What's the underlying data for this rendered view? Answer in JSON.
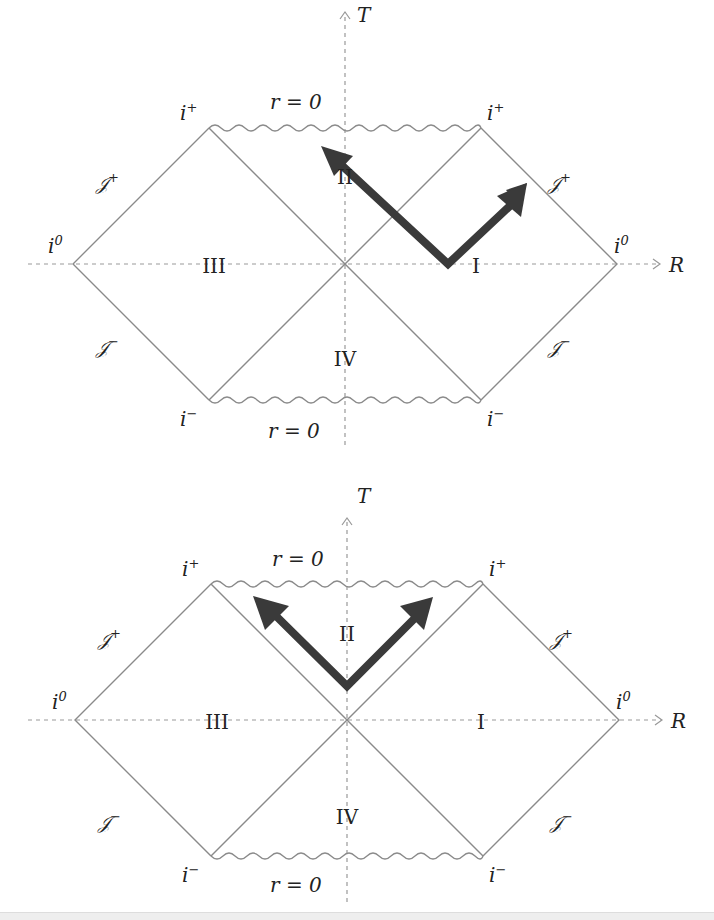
{
  "figure": {
    "colors": {
      "line": "#8a8a8a",
      "axis": "#999999",
      "arrow": "#3a3a3a",
      "text": "#222222"
    }
  },
  "diagrams": [
    {
      "id": "top",
      "axis_labels": {
        "time": "T",
        "space": "R"
      },
      "singularity_labels": {
        "future": "r = 0",
        "past": "r = 0"
      },
      "corner_labels": {
        "future_timelike_left": "i+",
        "future_timelike_right": "i+",
        "past_timelike_left": "i−",
        "past_timelike_right": "i−",
        "spatial_left": "i0",
        "spatial_right": "i0"
      },
      "null_infinity_labels": {
        "future_left": "𝒥+",
        "future_right": "𝒥+",
        "past_left": "𝒥−",
        "past_right": "𝒥−"
      },
      "regions": [
        "I",
        "II",
        "III",
        "IV"
      ],
      "arrows": [
        {
          "from_region": "I",
          "direction": "up-left",
          "into_region": "II"
        },
        {
          "from_region": "I",
          "direction": "up-right",
          "toward": "𝒥+"
        }
      ]
    },
    {
      "id": "bottom",
      "axis_labels": {
        "time": "T",
        "space": "R"
      },
      "singularity_labels": {
        "future": "r = 0",
        "past": "r = 0"
      },
      "corner_labels": {
        "future_timelike_left": "i+",
        "future_timelike_right": "i+",
        "past_timelike_left": "i−",
        "past_timelike_right": "i−",
        "spatial_left": "i0",
        "spatial_right": "i0"
      },
      "null_infinity_labels": {
        "future_left": "𝒥+",
        "future_right": "𝒥+",
        "past_left": "𝒥−",
        "past_right": "𝒥−"
      },
      "regions": [
        "I",
        "II",
        "III",
        "IV"
      ],
      "arrows": [
        {
          "from_region": "II",
          "direction": "up-left"
        },
        {
          "from_region": "II",
          "direction": "up-right"
        }
      ]
    }
  ],
  "text": {
    "T": "T",
    "R": "R",
    "r0": "r = 0",
    "i": "i",
    "plus": "+",
    "minus": "−",
    "zero": "0",
    "scri": "𝒥",
    "I": "I",
    "II": "II",
    "III": "III",
    "IV": "IV"
  }
}
